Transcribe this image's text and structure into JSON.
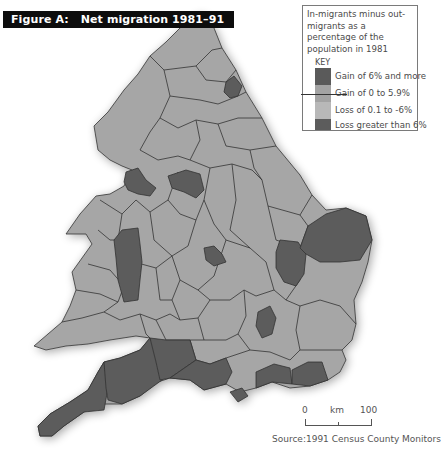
{
  "figure": {
    "label": "Figure A:",
    "title": "Net migration 1981–91"
  },
  "key": {
    "description": "In-migrants minus out-migrants as a percentage of the population in 1981",
    "heading": "KEY",
    "items": [
      {
        "label": "Gain of 6% and more",
        "color": "#5a5a5a"
      },
      {
        "label": "Gain of 0 to 5.9%",
        "color": "#a3a3a3"
      },
      {
        "label": "Loss of 0.1 to -6%",
        "color": "#b8b8b8"
      },
      {
        "label": "Loss greater than 6%",
        "color": "#5c5c5c"
      }
    ]
  },
  "scale": {
    "start": "0",
    "unit": "km",
    "end": "100"
  },
  "source": "Source:1991 Census County Monitors",
  "colors": {
    "light_region": "#a6a6a6",
    "dark_region": "#5b5b5b",
    "border": "#333333"
  }
}
